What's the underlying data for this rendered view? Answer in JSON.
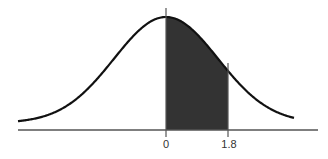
{
  "chart_data": {
    "type": "area",
    "title": "",
    "subtitle": "",
    "xlabel": "",
    "ylabel": "",
    "distribution": {
      "name": "standard normal",
      "mean": 0,
      "sd": 1
    },
    "shaded_region": {
      "from": 0,
      "to": 1.8,
      "color": "#333333"
    },
    "x_ticks": [
      {
        "value": 0,
        "label": "0"
      },
      {
        "value": 1.8,
        "label": "1.8"
      }
    ],
    "xlim": [
      -3.4,
      3.0
    ],
    "grid": false,
    "legend": null,
    "colors": {
      "curve": "#111111",
      "shade": "#333333",
      "axis": "#555555",
      "background": "#ffffff"
    }
  },
  "labels": {
    "tick_0": "0",
    "tick_1": "1.8"
  }
}
